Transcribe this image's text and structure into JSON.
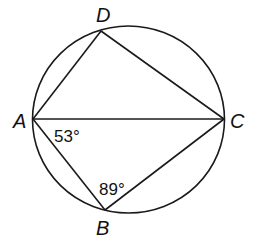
{
  "diagram": {
    "type": "inscribed-quadrilateral",
    "circle": {
      "cx": 128.5,
      "cy": 119.5,
      "rx": 96,
      "ry": 93.5
    },
    "points": {
      "A": {
        "label": "A",
        "x": 33,
        "y": 119
      },
      "B": {
        "label": "B",
        "x": 105,
        "y": 210
      },
      "C": {
        "label": "C",
        "x": 224,
        "y": 119
      },
      "D": {
        "label": "D",
        "x": 101,
        "y": 31
      }
    },
    "segments": [
      "AD",
      "DC",
      "AC",
      "AB",
      "BC"
    ],
    "angles": [
      {
        "vertex": "A",
        "between": "CAB",
        "text": "53°"
      },
      {
        "vertex": "B",
        "between": "ABC",
        "text": "89°"
      }
    ]
  },
  "labels": {
    "A": "A",
    "B": "B",
    "C": "C",
    "D": "D",
    "angle_A": "53°",
    "angle_B": "89°"
  },
  "colors": {
    "stroke": "#1a1a1a",
    "background": "#ffffff"
  }
}
